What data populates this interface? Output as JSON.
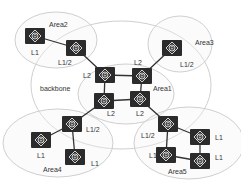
{
  "diagram": {
    "areas": [
      {
        "id": "backbone",
        "label": "backbone",
        "cx": 121,
        "cy": 85,
        "rx": 90,
        "ry": 64,
        "label_x": 40,
        "label_y": 91
      },
      {
        "id": "area1",
        "label": "Area1",
        "cx": 126,
        "cy": 94,
        "rx": 48,
        "ry": 30,
        "label_x": 153,
        "label_y": 91
      },
      {
        "id": "area2",
        "label": "Area2",
        "cx": 56,
        "cy": 40,
        "rx": 41,
        "ry": 28,
        "label_x": 49,
        "label_y": 27
      },
      {
        "id": "area3",
        "label": "Area3",
        "cx": 180,
        "cy": 44,
        "rx": 32,
        "ry": 28,
        "label_x": 195,
        "label_y": 45
      },
      {
        "id": "area4",
        "label": "Area4",
        "cx": 58,
        "cy": 143,
        "rx": 55,
        "ry": 34,
        "label_x": 43,
        "label_y": 172
      },
      {
        "id": "area5",
        "label": "Area5",
        "cx": 189,
        "cy": 143,
        "rx": 55,
        "ry": 36,
        "label_x": 168,
        "label_y": 174
      }
    ],
    "routers": [
      {
        "id": "r1",
        "x": 35,
        "y": 36,
        "level": "L1",
        "label_x": 31,
        "label_y": 55
      },
      {
        "id": "r2",
        "x": 76,
        "y": 48,
        "level": "L1/2",
        "label_x": 58,
        "label_y": 65
      },
      {
        "id": "r3",
        "x": 172,
        "y": 48,
        "level": "L1/2",
        "label_x": 180,
        "label_y": 67
      },
      {
        "id": "r4",
        "x": 105,
        "y": 75,
        "level": "L2",
        "label_x": 83,
        "label_y": 78
      },
      {
        "id": "r5",
        "x": 142,
        "y": 76,
        "level": "L2",
        "label_x": 134,
        "label_y": 65
      },
      {
        "id": "r6",
        "x": 104,
        "y": 101,
        "level": "L2",
        "label_x": 107,
        "label_y": 116
      },
      {
        "id": "r7",
        "x": 140,
        "y": 99,
        "level": "L2",
        "label_x": 136,
        "label_y": 116
      },
      {
        "id": "r8",
        "x": 72,
        "y": 124,
        "level": "L1/2",
        "label_x": 86,
        "label_y": 132
      },
      {
        "id": "r9",
        "x": 41,
        "y": 140,
        "level": "L1",
        "label_x": 37,
        "label_y": 158
      },
      {
        "id": "r10",
        "x": 75,
        "y": 157,
        "level": "L1",
        "label_x": 91,
        "label_y": 166
      },
      {
        "id": "r11",
        "x": 168,
        "y": 124,
        "level": "L1/2",
        "label_x": 141,
        "label_y": 138
      },
      {
        "id": "r12",
        "x": 200,
        "y": 137,
        "level": "L1",
        "label_x": 215,
        "label_y": 140
      },
      {
        "id": "r13",
        "x": 166,
        "y": 155,
        "level": "L1",
        "label_x": 149,
        "label_y": 158
      },
      {
        "id": "r14",
        "x": 200,
        "y": 161,
        "level": "L1",
        "label_x": 215,
        "label_y": 160
      }
    ],
    "links": [
      [
        "r1",
        "r2"
      ],
      [
        "r2",
        "r4"
      ],
      [
        "r3",
        "r5"
      ],
      [
        "r4",
        "r5"
      ],
      [
        "r4",
        "r6"
      ],
      [
        "r5",
        "r7"
      ],
      [
        "r6",
        "r7"
      ],
      [
        "r6",
        "r8"
      ],
      [
        "r8",
        "r9"
      ],
      [
        "r8",
        "r10"
      ],
      [
        "r7",
        "r11"
      ],
      [
        "r11",
        "r12"
      ],
      [
        "r11",
        "r13"
      ],
      [
        "r13",
        "r14"
      ],
      [
        "r12",
        "r14"
      ]
    ],
    "router_icon_glyph": "R",
    "colors": {
      "router": "#2b2b2b",
      "area_stroke": "#cfcfcf",
      "link": "#333333"
    }
  }
}
